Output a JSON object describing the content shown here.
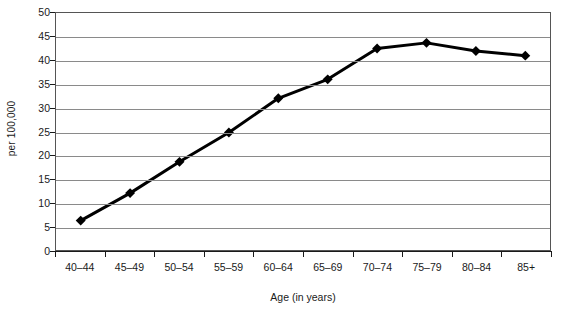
{
  "chart_data": {
    "type": "line",
    "title": "",
    "xlabel": "Age (in years)",
    "ylabel": "per 100,000",
    "categories": [
      "40–44",
      "45–49",
      "50–54",
      "55–59",
      "60–64",
      "65–69",
      "70–74",
      "75–79",
      "80–84",
      "85+"
    ],
    "values": [
      6.2,
      12.0,
      18.6,
      24.8,
      32.0,
      36.0,
      42.5,
      43.7,
      42.0,
      41.0
    ],
    "series": [
      {
        "name": "rate",
        "values": [
          6.2,
          12.0,
          18.6,
          24.8,
          32.0,
          36.0,
          42.5,
          43.7,
          42.0,
          41.0
        ]
      }
    ],
    "ylim": [
      0,
      50
    ],
    "ytick_values": [
      0,
      5,
      10,
      15,
      20,
      25,
      30,
      35,
      40,
      45,
      50
    ],
    "ytick_labels": [
      "0",
      "5",
      "10",
      "15",
      "20",
      "25",
      "30",
      "35",
      "40",
      "45",
      "50"
    ],
    "grid": "horizontal",
    "legend": "none",
    "marker": "diamond",
    "line_color": "#000000",
    "marker_color": "#000000",
    "grid_color": "#8a8a8a",
    "axis_color": "#1a1a1a",
    "plot_border_color": "#555555",
    "background_color": "#ffffff"
  }
}
